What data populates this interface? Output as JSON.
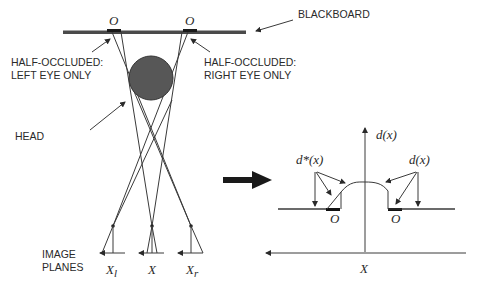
{
  "left_panel": {
    "blackboard_label": "BLACKBOARD",
    "occluded_marker_left": "O",
    "occluded_marker_right": "O",
    "half_occluded_left": [
      "HALF-OCCLUDED:",
      "LEFT EYE ONLY"
    ],
    "half_occluded_right": [
      "HALF-OCCLUDED:",
      "RIGHT EYE ONLY"
    ],
    "head_label": "HEAD",
    "image_planes_label": [
      "IMAGE",
      "PLANES"
    ],
    "eye_labels": {
      "left": {
        "base": "X",
        "sub": "l"
      },
      "cyclopean": {
        "base": "X",
        "sub": ""
      },
      "right": {
        "base": "X",
        "sub": "r"
      }
    }
  },
  "right_panel": {
    "y_axis_label": "d(x)",
    "x_axis_label": "X",
    "left_curve_label": "d*(x)",
    "right_curve_label": "d(x)",
    "occluded_marker_left": "O",
    "occluded_marker_right": "O"
  },
  "colors": {
    "ink": "#2a2a2a",
    "head_fill": "#555555",
    "background": "#ffffff"
  }
}
